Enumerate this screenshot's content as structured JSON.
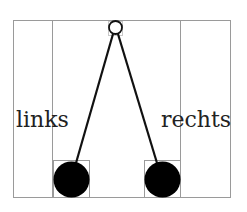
{
  "diagram": {
    "title": "",
    "labels": {
      "left": "links",
      "right": "rechts"
    },
    "colors": {
      "frame": "#9a9a9a",
      "rope": "#111111",
      "ball": "#000000",
      "pivot_fill": "#ffffff",
      "text": "#222222"
    },
    "nodes": [
      {
        "id": "pivot",
        "type": "hollow-circle"
      },
      {
        "id": "left-ball",
        "type": "filled-circle"
      },
      {
        "id": "right-ball",
        "type": "filled-circle"
      }
    ],
    "edges": [
      {
        "from": "pivot",
        "to": "left-ball"
      },
      {
        "from": "pivot",
        "to": "right-ball"
      }
    ]
  }
}
